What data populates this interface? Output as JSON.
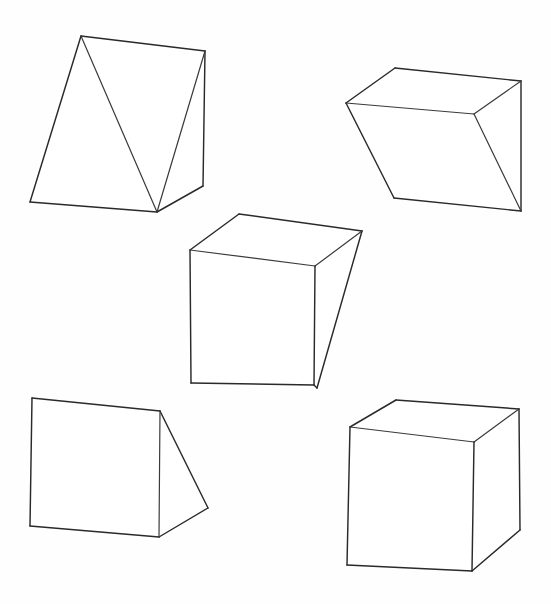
{
  "figure": {
    "background_color": "#fefefe",
    "stroke_color": "#2a2a2a",
    "face_fill": "#ffffff",
    "width": 551,
    "height": 604,
    "solid_count": 5
  },
  "solids": [
    {
      "id": "wedge-top-left",
      "label": "Triangular prism wedge, upper left",
      "shape_type": "triangular-prism",
      "outline": "81,36 205,51 203,186 157,212 30,202",
      "edges": [
        "81,36 205,51",
        "205,51 203,186",
        "203,186 157,212",
        "157,212 30,202",
        "30,202 81,36",
        "81,36 157,212",
        "205,51 157,212"
      ]
    },
    {
      "id": "wedge-top-right",
      "label": "Triangular prism wedge, upper right",
      "shape_type": "triangular-prism",
      "outline": "395,68 521,81 521,211 394,198 346,103",
      "edges": [
        "395,68 521,81",
        "521,81 521,211",
        "521,211 394,198",
        "394,198 346,103",
        "346,103 395,68",
        "346,103 474,114",
        "474,114 521,81",
        "474,114 521,211"
      ]
    },
    {
      "id": "cube-center",
      "label": "Cube, center",
      "shape_type": "cube",
      "outline": "239,214 362,231 317,388 314,385 191,383 190,250",
      "edges": [
        "239,214 362,231",
        "362,231 317,388",
        "191,383 190,250",
        "190,250 239,214",
        "190,250 315,266",
        "315,266 362,231",
        "315,266 314,385",
        "191,383 314,385",
        "314,385 317,388"
      ]
    },
    {
      "id": "wedge-bottom-left",
      "label": "Triangular prism wedge, lower left",
      "shape_type": "triangular-prism",
      "outline": "32,398 160,411 208,508 159,537 30,526",
      "edges": [
        "32,398 160,411",
        "160,411 208,508",
        "208,508 159,537",
        "159,537 30,526",
        "30,526 32,398",
        "160,411 159,537"
      ]
    },
    {
      "id": "cube-bottom-right",
      "label": "Cube, lower right",
      "shape_type": "cube",
      "outline": "396,400 519,409 520,530 472,571 347,565 350,427",
      "edges": [
        "396,400 519,409",
        "519,409 520,530",
        "520,530 472,571",
        "472,571 347,565",
        "347,565 350,427",
        "350,427 396,400",
        "350,427 474,442",
        "474,442 519,409",
        "474,442 472,571"
      ]
    }
  ]
}
